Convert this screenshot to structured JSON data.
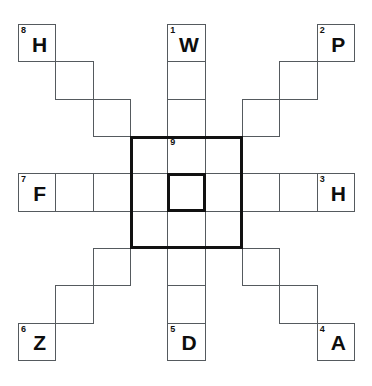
{
  "puzzle": {
    "type": "crossword-star-grid",
    "grid_size": 9,
    "cell_px": 37.33,
    "origin": {
      "x": 18,
      "y": 24
    },
    "colors": {
      "cell_border": "#555a5e",
      "bold_border": "#111111",
      "background": "#ffffff",
      "text": "#0d0d0d"
    },
    "center_box": {
      "col": 3,
      "row": 3,
      "cols": 3,
      "rows": 3
    },
    "center_inner_cell": {
      "col": 4,
      "row": 4
    },
    "cells": [
      {
        "col": 0,
        "row": 0,
        "number": "8",
        "letter": "H"
      },
      {
        "col": 1,
        "row": 1,
        "number": "",
        "letter": ""
      },
      {
        "col": 2,
        "row": 2,
        "number": "",
        "letter": ""
      },
      {
        "col": 3,
        "row": 3,
        "number": "",
        "letter": ""
      },
      {
        "col": 4,
        "row": 0,
        "number": "1",
        "letter": "W"
      },
      {
        "col": 4,
        "row": 1,
        "number": "",
        "letter": ""
      },
      {
        "col": 4,
        "row": 2,
        "number": "",
        "letter": ""
      },
      {
        "col": 4,
        "row": 3,
        "number": "9",
        "letter": ""
      },
      {
        "col": 8,
        "row": 0,
        "number": "2",
        "letter": "P"
      },
      {
        "col": 7,
        "row": 1,
        "number": "",
        "letter": ""
      },
      {
        "col": 6,
        "row": 2,
        "number": "",
        "letter": ""
      },
      {
        "col": 5,
        "row": 3,
        "number": "",
        "letter": ""
      },
      {
        "col": 0,
        "row": 4,
        "number": "7",
        "letter": "F"
      },
      {
        "col": 1,
        "row": 4,
        "number": "",
        "letter": ""
      },
      {
        "col": 2,
        "row": 4,
        "number": "",
        "letter": ""
      },
      {
        "col": 3,
        "row": 4,
        "number": "",
        "letter": ""
      },
      {
        "col": 4,
        "row": 4,
        "number": "",
        "letter": ""
      },
      {
        "col": 5,
        "row": 4,
        "number": "",
        "letter": ""
      },
      {
        "col": 6,
        "row": 4,
        "number": "",
        "letter": ""
      },
      {
        "col": 7,
        "row": 4,
        "number": "",
        "letter": ""
      },
      {
        "col": 8,
        "row": 4,
        "number": "3",
        "letter": "H"
      },
      {
        "col": 3,
        "row": 5,
        "number": "",
        "letter": ""
      },
      {
        "col": 2,
        "row": 6,
        "number": "",
        "letter": ""
      },
      {
        "col": 1,
        "row": 7,
        "number": "",
        "letter": ""
      },
      {
        "col": 0,
        "row": 8,
        "number": "6",
        "letter": "Z"
      },
      {
        "col": 4,
        "row": 5,
        "number": "",
        "letter": ""
      },
      {
        "col": 4,
        "row": 6,
        "number": "",
        "letter": ""
      },
      {
        "col": 4,
        "row": 7,
        "number": "",
        "letter": ""
      },
      {
        "col": 4,
        "row": 8,
        "number": "5",
        "letter": "D"
      },
      {
        "col": 5,
        "row": 5,
        "number": "",
        "letter": ""
      },
      {
        "col": 6,
        "row": 6,
        "number": "",
        "letter": ""
      },
      {
        "col": 7,
        "row": 7,
        "number": "",
        "letter": ""
      },
      {
        "col": 8,
        "row": 8,
        "number": "4",
        "letter": "A"
      }
    ]
  }
}
